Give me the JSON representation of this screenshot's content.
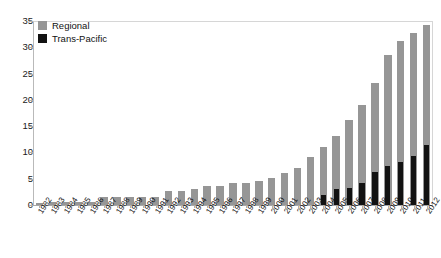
{
  "chart_data": {
    "type": "bar",
    "title": "",
    "subtitle": "",
    "xlabel": "",
    "ylabel": "",
    "ylim": [
      0,
      35
    ],
    "ytick_values": [
      0,
      5,
      10,
      15,
      20,
      25,
      30,
      35
    ],
    "ytick_labels": [
      "0",
      "5",
      "10",
      "15",
      "20",
      "25",
      "30",
      "35"
    ],
    "grid": false,
    "legend_position": "top-left-inside",
    "bar_style": "overlaid",
    "categories": [
      "1982",
      "1983",
      "1984",
      "1985",
      "1986",
      "1987",
      "1988",
      "1989",
      "1990",
      "1991",
      "1992",
      "1993",
      "1994",
      "1995",
      "1996",
      "1997",
      "1998",
      "1999",
      "2000",
      "2001",
      "2002",
      "2003",
      "2004",
      "2005",
      "2006",
      "2007",
      "2008",
      "2009",
      "2010",
      "2011",
      "2012"
    ],
    "series": [
      {
        "name": "Regional",
        "color": "#969696",
        "values": [
          0.4,
          0.5,
          0.5,
          0.5,
          0.6,
          1.6,
          1.6,
          1.6,
          1.6,
          1.6,
          2.6,
          2.7,
          3.0,
          3.6,
          3.6,
          4.1,
          4.2,
          4.6,
          5.1,
          6.1,
          7.0,
          9.1,
          11.1,
          13.1,
          16.1,
          19.1,
          23.2,
          28.6,
          31.2,
          32.7,
          34.2
        ]
      },
      {
        "name": "Trans-Pacific",
        "color": "#121212",
        "values": [
          0,
          0,
          0,
          0,
          0,
          0,
          0,
          0,
          0,
          0,
          0,
          0,
          0,
          0,
          0,
          0,
          0,
          0,
          0,
          0,
          0,
          0,
          1.9,
          3.0,
          3.3,
          4.2,
          6.3,
          7.4,
          8.1,
          9.4,
          11.4
        ]
      }
    ]
  },
  "legend": {
    "items": [
      {
        "label": "Regional",
        "color": "#969696"
      },
      {
        "label": "Trans-Pacific",
        "color": "#121212"
      }
    ]
  },
  "colors": {
    "regional": "#969696",
    "trans_pacific": "#121212",
    "axis": "#b0b0b0",
    "text": "#111111",
    "background": "#ffffff"
  }
}
